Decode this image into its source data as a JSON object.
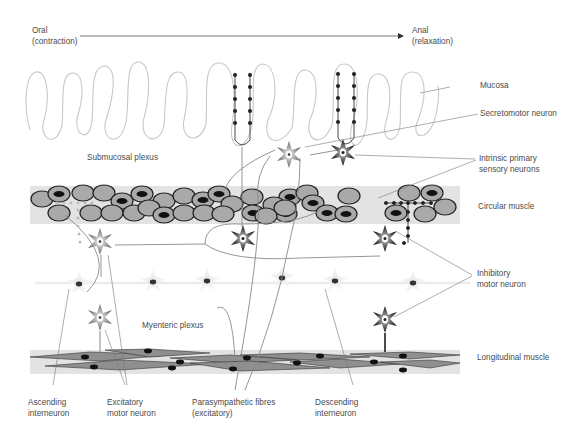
{
  "direction": {
    "start_label": "Oral",
    "start_sub": "(contraction)",
    "end_label": "Anal",
    "end_sub": "(relaxation)"
  },
  "layers": {
    "mucosa": "Mucosa",
    "submucosal_plexus": "Submucosal plexus",
    "circular_muscle": "Circular muscle",
    "myenteric_plexus": "Myenteric plexus",
    "longitudinal_muscle": "Longitudinal muscle"
  },
  "neuron_labels": {
    "secretomotor": "Secretomotor neuron",
    "ipan_line1": "Intrinsic primary",
    "ipan_line2": "sensory neurons",
    "inhibitory_line1": "Inhibitory",
    "inhibitory_line2": "motor neuron",
    "ascending_line1": "Ascending",
    "ascending_line2": "interneuron",
    "excitatory_line1": "Excitatory",
    "excitatory_line2": "motor neuron",
    "parasym_line1": "Parasympathetic fibres",
    "parasym_line2": "(excitatory)",
    "descending_line1": "Descending",
    "descending_line2": "interneuron"
  },
  "colors": {
    "muscle_band": "#e3e3e3",
    "cell_fill": "#a9a9a9",
    "mucosa_line": "#c8c8c8",
    "dark_neuron": "#1a1a1a",
    "grey_neuron": "#9a9a9a",
    "leader_line": "#777777"
  }
}
